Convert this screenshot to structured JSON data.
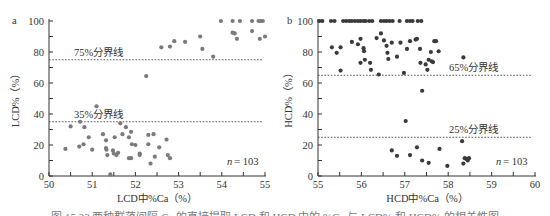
{
  "chart_data": [
    {
      "type": "scatter",
      "panel_label": "a",
      "xlabel": "LCD中%Ca（%）",
      "ylabel": "LCD%（%）",
      "xlim": [
        50,
        55
      ],
      "ylim": [
        0,
        100
      ],
      "x_ticks": [
        "50",
        "51",
        "52",
        "53",
        "54",
        "55"
      ],
      "y_ticks": [
        "0",
        "20",
        "40",
        "60",
        "80",
        "100"
      ],
      "grid": false,
      "thresholds": [
        {
          "value": 75,
          "label": "75%分界线"
        },
        {
          "value": 35,
          "label": "35%分界线"
        }
      ],
      "annotation": "n = 103",
      "annotation_n": "n",
      "annotation_value": "= 103",
      "color": "#7a7a7a",
      "points": [
        [
          52.6,
          83
        ],
        [
          52.8,
          83.5
        ],
        [
          52.9,
          87
        ],
        [
          53.15,
          86.5
        ],
        [
          53.5,
          90
        ],
        [
          53.55,
          82
        ],
        [
          53.8,
          77
        ],
        [
          53.98,
          100
        ],
        [
          54.25,
          100
        ],
        [
          54.42,
          100
        ],
        [
          54.7,
          100
        ],
        [
          54.85,
          100
        ],
        [
          54.9,
          100
        ],
        [
          54.95,
          100
        ],
        [
          54.25,
          92.5
        ],
        [
          54.3,
          92
        ],
        [
          54.35,
          88.5
        ],
        [
          54.7,
          93.5
        ],
        [
          54.88,
          88.5
        ],
        [
          55.0,
          90
        ],
        [
          52.25,
          64.5
        ],
        [
          51.1,
          45
        ],
        [
          50.38,
          17.5
        ],
        [
          50.5,
          32
        ],
        [
          50.72,
          35
        ],
        [
          50.7,
          19
        ],
        [
          50.82,
          31.5
        ],
        [
          50.8,
          20.5
        ],
        [
          50.92,
          25
        ],
        [
          51.0,
          17
        ],
        [
          51.25,
          27
        ],
        [
          51.32,
          23
        ],
        [
          51.32,
          18
        ],
        [
          51.33,
          17
        ],
        [
          51.35,
          13.5
        ],
        [
          51.42,
          1
        ],
        [
          51.48,
          16.5
        ],
        [
          51.5,
          14.5
        ],
        [
          51.52,
          25
        ],
        [
          51.56,
          13.5
        ],
        [
          51.6,
          15
        ],
        [
          51.65,
          34
        ],
        [
          51.7,
          27
        ],
        [
          51.78,
          31.5
        ],
        [
          51.85,
          25
        ],
        [
          51.85,
          11.5
        ],
        [
          51.9,
          11.5
        ],
        [
          51.9,
          28.5
        ],
        [
          51.92,
          20.5
        ],
        [
          52.0,
          20
        ],
        [
          52.1,
          14.5
        ],
        [
          52.1,
          13.5
        ],
        [
          52.3,
          26.5
        ],
        [
          52.3,
          20.5
        ],
        [
          52.35,
          8
        ],
        [
          52.42,
          27
        ],
        [
          52.45,
          12.5
        ],
        [
          52.55,
          18.5
        ],
        [
          52.72,
          23.5
        ],
        [
          52.75,
          13.5
        ],
        [
          52.8,
          11.5
        ]
      ]
    },
    {
      "type": "scatter",
      "panel_label": "b",
      "xlabel": "HCD中%Ca（%）",
      "ylabel": "HCD%（%）",
      "xlim": [
        55,
        60
      ],
      "ylim": [
        0,
        100
      ],
      "x_ticks": [
        "55",
        "56",
        "57",
        "58",
        "59",
        "60"
      ],
      "y_ticks": [
        "0",
        "20",
        "40",
        "60",
        "80",
        "100"
      ],
      "grid": false,
      "thresholds": [
        {
          "value": 65,
          "label": "65%分界线"
        },
        {
          "value": 25,
          "label": "25%分界线"
        }
      ],
      "annotation": "n = 103",
      "annotation_n": "n",
      "annotation_value": "= 103",
      "color": "#3a3a3a",
      "points": [
        [
          55.03,
          100
        ],
        [
          55.1,
          100
        ],
        [
          55.3,
          100
        ],
        [
          55.38,
          100
        ],
        [
          55.58,
          100
        ],
        [
          55.65,
          100
        ],
        [
          55.72,
          100
        ],
        [
          55.78,
          100
        ],
        [
          55.85,
          100
        ],
        [
          55.92,
          100
        ],
        [
          55.98,
          100
        ],
        [
          56.05,
          100
        ],
        [
          56.1,
          100
        ],
        [
          56.18,
          100
        ],
        [
          56.25,
          100
        ],
        [
          56.45,
          100
        ],
        [
          56.52,
          100
        ],
        [
          56.58,
          100
        ],
        [
          56.65,
          100
        ],
        [
          56.72,
          100
        ],
        [
          56.88,
          100
        ],
        [
          57.05,
          100
        ],
        [
          57.12,
          100
        ],
        [
          57.18,
          100
        ],
        [
          57.3,
          100
        ],
        [
          57.38,
          100
        ],
        [
          55.32,
          83
        ],
        [
          55.43,
          79.5
        ],
        [
          55.52,
          83
        ],
        [
          55.52,
          68
        ],
        [
          55.78,
          86.5
        ],
        [
          55.92,
          85
        ],
        [
          55.98,
          88.5
        ],
        [
          55.98,
          73
        ],
        [
          56.05,
          82.5
        ],
        [
          56.06,
          80.5
        ],
        [
          56.08,
          75
        ],
        [
          56.2,
          73
        ],
        [
          56.22,
          68.5
        ],
        [
          56.35,
          89
        ],
        [
          56.4,
          65.5
        ],
        [
          56.45,
          92
        ],
        [
          56.52,
          87.5
        ],
        [
          56.58,
          84
        ],
        [
          56.6,
          79.5
        ],
        [
          56.62,
          75.5
        ],
        [
          56.7,
          86
        ],
        [
          56.82,
          77
        ],
        [
          56.9,
          86
        ],
        [
          56.98,
          66.5
        ],
        [
          57.05,
          82
        ],
        [
          57.12,
          87
        ],
        [
          57.25,
          88
        ],
        [
          57.28,
          88.5
        ],
        [
          57.35,
          82
        ],
        [
          57.36,
          73
        ],
        [
          57.4,
          55
        ],
        [
          57.48,
          72
        ],
        [
          57.52,
          68.5
        ],
        [
          57.55,
          75
        ],
        [
          57.6,
          80
        ],
        [
          57.62,
          74
        ],
        [
          57.65,
          73.5
        ],
        [
          57.68,
          87
        ],
        [
          57.72,
          87
        ],
        [
          57.78,
          80.5
        ],
        [
          58.35,
          76.5
        ],
        [
          57.02,
          35.5
        ],
        [
          56.7,
          16.5
        ],
        [
          56.82,
          13
        ],
        [
          57.12,
          13.5
        ],
        [
          57.28,
          18.5
        ],
        [
          57.4,
          10
        ],
        [
          57.55,
          8.5
        ],
        [
          57.8,
          17.5
        ],
        [
          57.98,
          6.5
        ],
        [
          58.32,
          22.5
        ],
        [
          58.35,
          8
        ],
        [
          58.38,
          11.5
        ],
        [
          58.42,
          11
        ],
        [
          58.45,
          10
        ],
        [
          58.48,
          11.5
        ]
      ]
    }
  ],
  "caption": "图 15.23  两种群落间隔 Ca 的直接提取 LCD 和 HCD 中的 %Ca 与 LCD% 和 HCD% 的相关性图"
}
